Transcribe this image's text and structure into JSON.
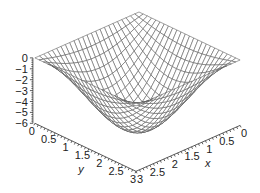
{
  "chart_data": {
    "type": "surface",
    "title": "",
    "function": "z = -6.5 * sin(pi*x/3) * sin(pi*y/3)",
    "x": {
      "label": "x",
      "range": [
        0,
        3
      ],
      "ticks": [
        "0",
        "0.5",
        "1",
        "1.5",
        "2",
        "2.5",
        "3"
      ],
      "tick_values": [
        0,
        0.5,
        1,
        1.5,
        2,
        2.5,
        3
      ]
    },
    "y": {
      "label": "y",
      "range": [
        0,
        3
      ],
      "ticks": [
        "0",
        "0.5",
        "1",
        "1.5",
        "2",
        "2.5",
        "3"
      ],
      "tick_values": [
        0,
        0.5,
        1,
        1.5,
        2,
        2.5,
        3
      ]
    },
    "z": {
      "label": "",
      "range": [
        -6,
        0
      ],
      "ticks": [
        "0",
        "−1",
        "−2",
        "−3",
        "−4",
        "−5",
        "−6"
      ],
      "tick_values": [
        0,
        -1,
        -2,
        -3,
        -4,
        -5,
        -6
      ]
    },
    "amplitude": 6.5,
    "grid_lines": 24,
    "colors": {
      "mesh": "#555555",
      "axis": "#333333",
      "text": "#222222",
      "background": "#ffffff"
    }
  }
}
